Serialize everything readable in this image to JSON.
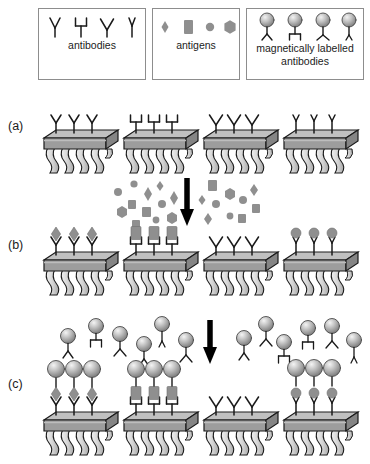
{
  "figure": {
    "type": "sandwich-immunoassay-schematic",
    "panel_labels": [
      "(a)",
      "(b)",
      "(c)"
    ],
    "columns": 4,
    "palette": {
      "chip_top": "#b9b9b9",
      "chip_front": "#9a9a9a",
      "chip_side": "#8a8a8a",
      "chip_outline": "#1a1a1a",
      "leg_fill": "#d9d9d9",
      "leg_outline": "#1a1a1a",
      "antigen_gray": "#8f8f8f",
      "bead_light": "#eeeeee",
      "bead_mid": "#b6b6b6",
      "bead_dark": "#7e7e7e",
      "ink": "#1a1a1a",
      "legend_border": "#8d8d8d",
      "arrow": "#000000"
    }
  },
  "legend": {
    "boxes": [
      {
        "id": "antibodies",
        "caption": "antibodies",
        "glyph_kind": "antibody",
        "items": [
          {
            "variant": "Y"
          },
          {
            "variant": "U"
          },
          {
            "variant": "V"
          },
          {
            "variant": "I"
          }
        ]
      },
      {
        "id": "antigens",
        "caption": "antigens",
        "glyph_kind": "antigen",
        "items": [
          {
            "shape": "diamond"
          },
          {
            "shape": "rect"
          },
          {
            "shape": "circle"
          },
          {
            "shape": "hexagon"
          }
        ]
      },
      {
        "id": "magnetically-labelled-antibodies",
        "caption": "magnetically labelled\nantibodies",
        "caption_line1": "magnetically labelled",
        "caption_line2": "antibodies",
        "glyph_kind": "labelled-antibody",
        "items": [
          {
            "variant": "Y"
          },
          {
            "variant": "U"
          },
          {
            "variant": "V"
          },
          {
            "variant": "I"
          }
        ]
      }
    ]
  },
  "rows": {
    "a": {
      "label": "(a)",
      "description": "sensor chips functionalised with capture antibodies",
      "chips": [
        {
          "antibody_variant": "Y",
          "antigen": null,
          "bead": false
        },
        {
          "antibody_variant": "U",
          "antigen": null,
          "bead": false
        },
        {
          "antibody_variant": "V",
          "antigen": null,
          "bead": false
        },
        {
          "antibody_variant": "I",
          "antigen": null,
          "bead": false
        }
      ]
    },
    "b": {
      "label": "(b)",
      "description": "antigens captured by matching antibodies",
      "chips": [
        {
          "antibody_variant": "Y",
          "antigen": "diamond",
          "bead": false
        },
        {
          "antibody_variant": "U",
          "antigen": "rect",
          "bead": false
        },
        {
          "antibody_variant": "V",
          "antigen": null,
          "bead": false
        },
        {
          "antibody_variant": "I",
          "antigen": "circle",
          "bead": false
        }
      ]
    },
    "c": {
      "label": "(c)",
      "description": "magnetically labelled detection antibodies complete the sandwich",
      "chips": [
        {
          "antibody_variant": "Y",
          "antigen": "diamond",
          "bead": true
        },
        {
          "antibody_variant": "U",
          "antigen": "rect",
          "bead": true
        },
        {
          "antibody_variant": "V",
          "antigen": null,
          "bead": false
        },
        {
          "antibody_variant": "I",
          "antigen": "circle",
          "bead": true
        }
      ]
    }
  },
  "steps": {
    "antigen_incubation": {
      "id": "antigen-cloud-step",
      "arrow": "down",
      "cloud_kind": "antigens",
      "cloud_items": [
        {
          "shape": "circle",
          "x": 6,
          "y": 14,
          "s": 7
        },
        {
          "shape": "rect",
          "x": 20,
          "y": 26,
          "s": 7
        },
        {
          "shape": "circle",
          "x": 22,
          "y": 6,
          "s": 6
        },
        {
          "shape": "diamond",
          "x": 36,
          "y": 16,
          "s": 7
        },
        {
          "shape": "hexagon",
          "x": 10,
          "y": 34,
          "s": 7
        },
        {
          "shape": "rect",
          "x": 34,
          "y": 33,
          "s": 8
        },
        {
          "shape": "diamond",
          "x": 48,
          "y": 8,
          "s": 6
        },
        {
          "shape": "circle",
          "x": 50,
          "y": 26,
          "s": 7
        },
        {
          "shape": "diamond",
          "x": 60,
          "y": 20,
          "s": 8
        },
        {
          "shape": "rect",
          "x": 24,
          "y": 44,
          "s": 7
        },
        {
          "shape": "circle",
          "x": 44,
          "y": 42,
          "s": 6
        },
        {
          "shape": "hexagon",
          "x": 60,
          "y": 40,
          "s": 7
        },
        {
          "shape": "rect",
          "x": 100,
          "y": 6,
          "s": 8
        },
        {
          "shape": "diamond",
          "x": 90,
          "y": 22,
          "s": 6
        },
        {
          "shape": "circle",
          "x": 104,
          "y": 26,
          "s": 7
        },
        {
          "shape": "hexagon",
          "x": 118,
          "y": 16,
          "s": 7
        },
        {
          "shape": "circle",
          "x": 131,
          "y": 22,
          "s": 7
        },
        {
          "shape": "diamond",
          "x": 142,
          "y": 12,
          "s": 7
        },
        {
          "shape": "rect",
          "x": 144,
          "y": 30,
          "s": 7
        },
        {
          "shape": "diamond",
          "x": 96,
          "y": 40,
          "s": 7
        },
        {
          "shape": "circle",
          "x": 118,
          "y": 38,
          "s": 6
        },
        {
          "shape": "rect",
          "x": 130,
          "y": 40,
          "s": 7
        }
      ]
    },
    "label_incubation": {
      "id": "labelled-antibody-cloud-step",
      "arrow": "down",
      "cloud_kind": "labelled-antibodies",
      "cloud_items": [
        {
          "variant": "Y",
          "x": 4,
          "y": 18
        },
        {
          "variant": "U",
          "x": 30,
          "y": 4
        },
        {
          "variant": "V",
          "x": 54,
          "y": 12
        },
        {
          "variant": "Y",
          "x": 78,
          "y": 22
        },
        {
          "variant": "I",
          "x": 96,
          "y": 2
        },
        {
          "variant": "V",
          "x": 120,
          "y": 18
        },
        {
          "variant": "Y",
          "x": 168,
          "y": 16
        },
        {
          "variant": "V",
          "x": 190,
          "y": 2
        },
        {
          "variant": "I",
          "x": 210,
          "y": 22
        },
        {
          "variant": "U",
          "x": 234,
          "y": 6
        },
        {
          "variant": "V",
          "x": 258,
          "y": 4
        },
        {
          "variant": "I",
          "x": 282,
          "y": 20
        }
      ]
    }
  }
}
